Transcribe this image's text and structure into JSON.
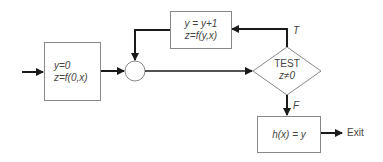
{
  "diagram": {
    "type": "flowchart",
    "init_box": {
      "line1": "y=0",
      "line2": "z=f(0,x)"
    },
    "update_box": {
      "line1": "y = y+1",
      "line2": "z=f(y,x)"
    },
    "junction": {
      "shape": "circle"
    },
    "decision": {
      "line1": "TEST",
      "line2": "z≠0"
    },
    "branch_true": "T",
    "branch_false": "F",
    "output_box": {
      "text": "h(x) = y"
    },
    "exit_label": "Exit",
    "colors": {
      "line": "#1a1a1a",
      "box_border": "#888888",
      "text": "#444444"
    }
  }
}
